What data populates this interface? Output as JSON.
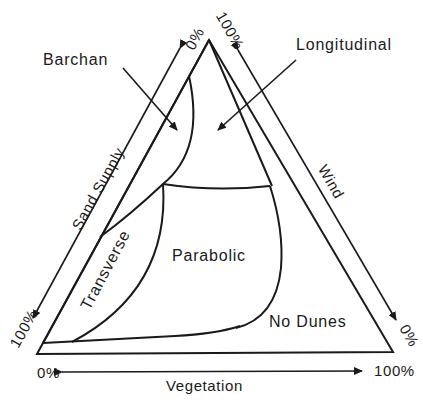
{
  "diagram": {
    "region_labels": {
      "barchan": "Barchan",
      "longitudinal": "Longitudinal",
      "transverse": "Transverse",
      "parabolic": "Parabolic",
      "no_dunes": "No Dunes"
    },
    "axes": {
      "sand_supply": {
        "label": "Sand Supply",
        "start": "100%",
        "end": "0%"
      },
      "wind": {
        "label": "Wind",
        "start": "100%",
        "end": "0%"
      },
      "vegetation": {
        "label": "Vegetation",
        "start": "0%",
        "end": "100%"
      }
    },
    "colors": {
      "line": "#1a1a1a",
      "background": "#ffffff"
    }
  }
}
